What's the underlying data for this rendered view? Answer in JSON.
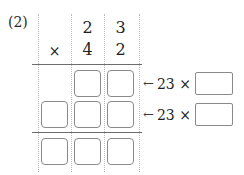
{
  "problem": {
    "label": "(2)",
    "multiplicand": "23",
    "multiplier": "42",
    "operator": "×"
  },
  "columns": {
    "top_row_digits": [
      "",
      "2",
      "3"
    ],
    "bottom_row_digits": [
      "×",
      "4",
      "2"
    ]
  },
  "grid": {
    "partial_product_row_1": [
      "",
      "",
      ""
    ],
    "partial_product_row_2": [
      "",
      "",
      ""
    ],
    "total_row": [
      "",
      "",
      ""
    ]
  },
  "annotations": [
    {
      "arrow": "←",
      "text": "23 ×",
      "value": ""
    },
    {
      "arrow": "←",
      "text": "23 ×",
      "value": ""
    }
  ],
  "colors": {
    "ink": "#1f1f1f",
    "box_border": "#8a8a8a",
    "rule": "#6d6d6d",
    "guide": "#b9b9b9",
    "paper": "#ffffff"
  }
}
